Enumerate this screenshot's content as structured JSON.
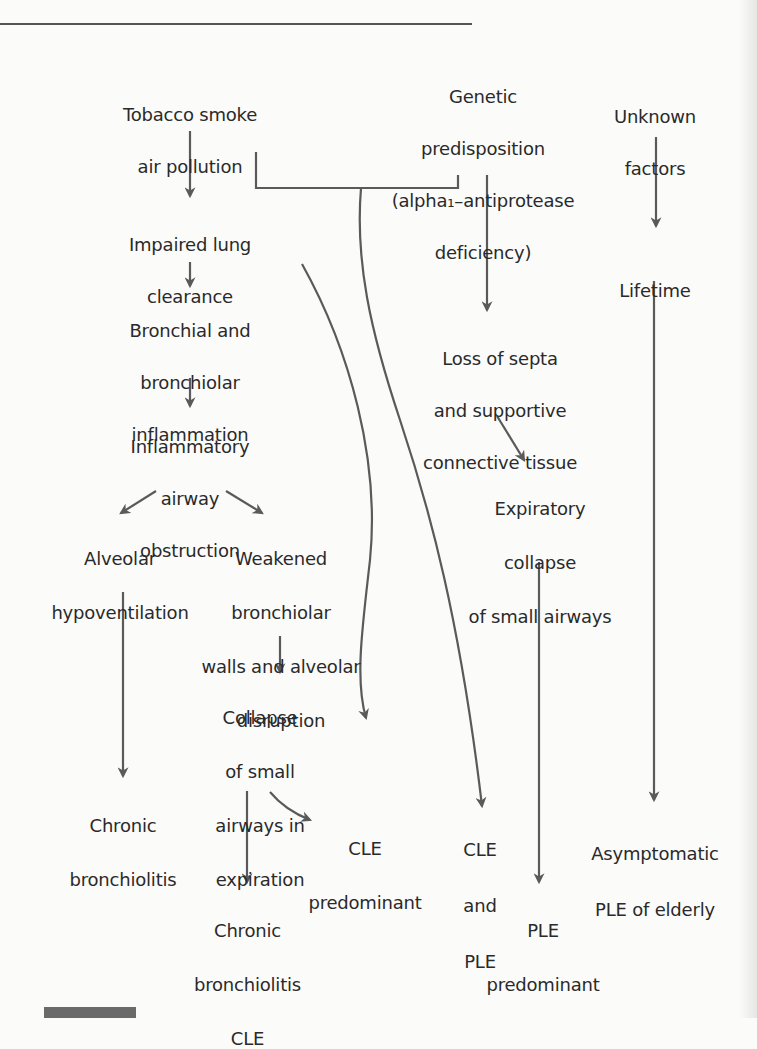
{
  "figure": {
    "line_color": "#5a5a5a",
    "background": "#fbfbfa"
  },
  "nodes": {
    "tobacco": {
      "lines": [
        "Tobacco smoke",
        "air pollution"
      ]
    },
    "genetic": {
      "lines": [
        "Genetic",
        "predisposition",
        "(alpha₁–antiprotease",
        "deficiency)"
      ]
    },
    "unknown": {
      "lines": [
        "Unknown",
        "factors"
      ]
    },
    "impaired": {
      "lines": [
        "Impaired lung",
        "clearance"
      ]
    },
    "lifetime": {
      "lines": [
        "Lifetime"
      ]
    },
    "bronchial": {
      "lines": [
        "Bronchial and",
        "bronchiolar",
        "inflammation"
      ]
    },
    "loss_septa": {
      "lines": [
        "Loss of septa",
        "and supportive",
        "connective tissue"
      ]
    },
    "inflammatory": {
      "lines": [
        "Inflammatory",
        "airway",
        "obstruction"
      ]
    },
    "expiratory": {
      "lines": [
        "Expiratory",
        "collapse",
        "of small airways"
      ]
    },
    "alveolar": {
      "lines": [
        "Alveolar",
        "hypoventilation"
      ]
    },
    "weakened": {
      "lines": [
        "Weakened",
        "bronchiolar",
        "walls and alveolar",
        "disruption"
      ]
    },
    "collapse": {
      "lines": [
        "Collapse",
        "of small",
        "airways in",
        "expiration"
      ]
    },
    "chronic_bronch": {
      "lines": [
        "Chronic",
        "bronchiolitis"
      ]
    },
    "cle_pred": {
      "lines": [
        "CLE",
        "predominant"
      ]
    },
    "cle_ple": {
      "lines": [
        "CLE",
        "and",
        "PLE"
      ]
    },
    "asymptomatic": {
      "lines": [
        "Asymptomatic",
        "PLE of elderly"
      ]
    },
    "chronic_cle": {
      "lines": [
        "Chronic",
        "bronchiolitis",
        "CLE"
      ]
    },
    "ple_pred": {
      "lines": [
        "PLE",
        "predominant"
      ]
    }
  },
  "edges": [
    {
      "from": "tobacco",
      "to": "impaired"
    },
    {
      "from": "impaired",
      "to": "bronchial"
    },
    {
      "from": "bronchial",
      "to": "inflammatory"
    },
    {
      "from": "inflammatory",
      "to": "alveolar"
    },
    {
      "from": "inflammatory",
      "to": "weakened"
    },
    {
      "from": "weakened",
      "to": "collapse"
    },
    {
      "from": "alveolar",
      "to": "chronic_bronch"
    },
    {
      "from": "collapse",
      "to": "chronic_cle"
    },
    {
      "from": "collapse",
      "to": "cle_pred"
    },
    {
      "from": "impaired",
      "to": "collapse"
    },
    {
      "from": "tobacco+genetic",
      "to": "cle_ple"
    },
    {
      "from": "genetic",
      "to": "loss_septa"
    },
    {
      "from": "loss_septa",
      "to": "expiratory"
    },
    {
      "from": "expiratory",
      "to": "ple_pred"
    },
    {
      "from": "unknown",
      "to": "lifetime"
    },
    {
      "from": "lifetime",
      "to": "asymptomatic"
    }
  ]
}
